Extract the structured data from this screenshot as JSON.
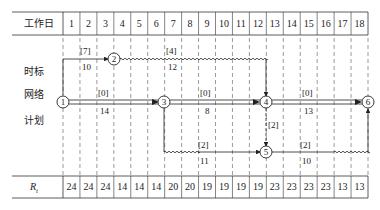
{
  "header": {
    "label": "工作日",
    "days": [
      "1",
      "2",
      "3",
      "4",
      "5",
      "6",
      "7",
      "8",
      "9",
      "10",
      "11",
      "12",
      "13",
      "14",
      "15",
      "16",
      "17",
      "18"
    ]
  },
  "side_labels": [
    "时标",
    "网络",
    "计划"
  ],
  "resource_row": {
    "label": "R",
    "subscript": "t",
    "values": [
      "24",
      "24",
      "24",
      "14",
      "14",
      "14",
      "20",
      "20",
      "19",
      "19",
      "19",
      "19",
      "23",
      "23",
      "23",
      "23",
      "13",
      "13"
    ]
  },
  "nodes": [
    {
      "id": "1",
      "day": 0,
      "row": "main"
    },
    {
      "id": "2",
      "day": 3,
      "row": "top"
    },
    {
      "id": "3",
      "day": 6,
      "row": "main"
    },
    {
      "id": "4",
      "day": 12,
      "row": "main"
    },
    {
      "id": "5",
      "day": 12,
      "row": "bottom"
    },
    {
      "id": "6",
      "day": 18,
      "row": "main"
    }
  ],
  "activities": [
    {
      "from": "1",
      "to": "2",
      "float": "[7]",
      "resource": "10"
    },
    {
      "from": "2",
      "to": "4",
      "float": "[4]",
      "resource": "12",
      "free_float_wavy": true
    },
    {
      "from": "1",
      "to": "3",
      "float": "[0]",
      "resource": "14",
      "critical": true
    },
    {
      "from": "3",
      "to": "4",
      "float": "[0]",
      "resource": "8",
      "critical": true
    },
    {
      "from": "4",
      "to": "6",
      "float": "[0]",
      "resource": "13",
      "critical": true
    },
    {
      "from": "3",
      "to": "5",
      "float": "[2]",
      "resource": "11",
      "free_float_wavy": true
    },
    {
      "from": "4",
      "to": "5",
      "float": "[2]",
      "dummy": true
    },
    {
      "from": "5",
      "to": "6",
      "float": "[2]",
      "resource": "10",
      "free_float_wavy": true
    }
  ]
}
